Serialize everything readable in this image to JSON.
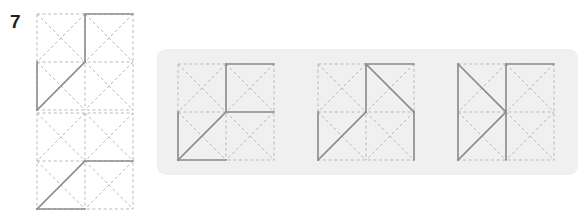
{
  "question": {
    "number": "7",
    "type": "visual-analogy-figure-matrix"
  },
  "colors": {
    "panel_background": "#f0f0f0",
    "page_background": "#ffffff",
    "dashed_grid_line": "#b9b9b9",
    "solid_shape_line": "#8c8c8c",
    "number_text": "#231f20"
  },
  "geometry": {
    "cell": 48,
    "figure_size": 96,
    "dash_pattern": "3 2.6",
    "dash_width": 1,
    "solid_width": 1.6
  },
  "prompt_figures": [
    {
      "name": "prompt-figure-1",
      "label": "Top prompt figure",
      "grid": "2x2 squares each with dashed diagonals forming an X",
      "solid_segments": [
        {
          "from": [
            48,
            0
          ],
          "to": [
            96,
            0
          ],
          "desc": "top edge of top-right square"
        },
        {
          "from": [
            48,
            0
          ],
          "to": [
            48,
            48
          ],
          "desc": "vertical center line, upper half"
        },
        {
          "from": [
            0,
            48
          ],
          "to": [
            0,
            96
          ],
          "desc": "left edge of bottom-left square"
        },
        {
          "from": [
            0,
            96
          ],
          "to": [
            48,
            48
          ],
          "desc": "diagonal of bottom-left square"
        }
      ]
    },
    {
      "name": "prompt-figure-2",
      "label": "Bottom prompt figure",
      "grid": "2x2 squares each with dashed diagonals forming an X",
      "solid_segments": [
        {
          "from": [
            48,
            48
          ],
          "to": [
            96,
            48
          ],
          "desc": "horizontal center line, right half"
        },
        {
          "from": [
            0,
            96
          ],
          "to": [
            48,
            48
          ],
          "desc": "diagonal of bottom-left square"
        },
        {
          "from": [
            0,
            96
          ],
          "to": [
            48,
            96
          ],
          "desc": "bottom edge of bottom-left square"
        }
      ]
    }
  ],
  "options": [
    {
      "name": "option-1",
      "label": "Answer option 1",
      "solid_segments": [
        {
          "from": [
            48,
            0
          ],
          "to": [
            96,
            0
          ],
          "desc": "top edge of top-right square"
        },
        {
          "from": [
            48,
            0
          ],
          "to": [
            48,
            48
          ],
          "desc": "vertical center line, upper half"
        },
        {
          "from": [
            48,
            48
          ],
          "to": [
            96,
            48
          ],
          "desc": "horizontal center line, right half"
        },
        {
          "from": [
            0,
            48
          ],
          "to": [
            0,
            96
          ],
          "desc": "left edge of bottom-left square"
        },
        {
          "from": [
            0,
            96
          ],
          "to": [
            48,
            48
          ],
          "desc": "diagonal of bottom-left square"
        },
        {
          "from": [
            0,
            96
          ],
          "to": [
            48,
            96
          ],
          "desc": "bottom edge of bottom-left square"
        }
      ]
    },
    {
      "name": "option-2",
      "label": "Answer option 2",
      "solid_segments": [
        {
          "from": [
            48,
            0
          ],
          "to": [
            96,
            0
          ],
          "desc": "top edge of top-right square"
        },
        {
          "from": [
            48,
            0
          ],
          "to": [
            48,
            48
          ],
          "desc": "vertical center line, upper half"
        },
        {
          "from": [
            48,
            0
          ],
          "to": [
            96,
            48
          ],
          "desc": "diagonal of top-right square"
        },
        {
          "from": [
            96,
            48
          ],
          "to": [
            96,
            96
          ],
          "desc": "right edge of bottom-right square"
        },
        {
          "from": [
            0,
            48
          ],
          "to": [
            0,
            96
          ],
          "desc": "left edge of bottom-left square"
        },
        {
          "from": [
            0,
            96
          ],
          "to": [
            48,
            48
          ],
          "desc": "diagonal of bottom-left square"
        }
      ]
    },
    {
      "name": "option-3",
      "label": "Answer option 3",
      "solid_segments": [
        {
          "from": [
            48,
            0
          ],
          "to": [
            96,
            0
          ],
          "desc": "top edge of top-right square"
        },
        {
          "from": [
            48,
            0
          ],
          "to": [
            48,
            96
          ],
          "desc": "full vertical center line"
        },
        {
          "from": [
            0,
            0
          ],
          "to": [
            0,
            96
          ],
          "desc": "left edge, full height"
        },
        {
          "from": [
            0,
            0
          ],
          "to": [
            48,
            48
          ],
          "desc": "diagonal of top-left square"
        },
        {
          "from": [
            0,
            96
          ],
          "to": [
            48,
            48
          ],
          "desc": "diagonal of bottom-left square"
        }
      ]
    }
  ]
}
